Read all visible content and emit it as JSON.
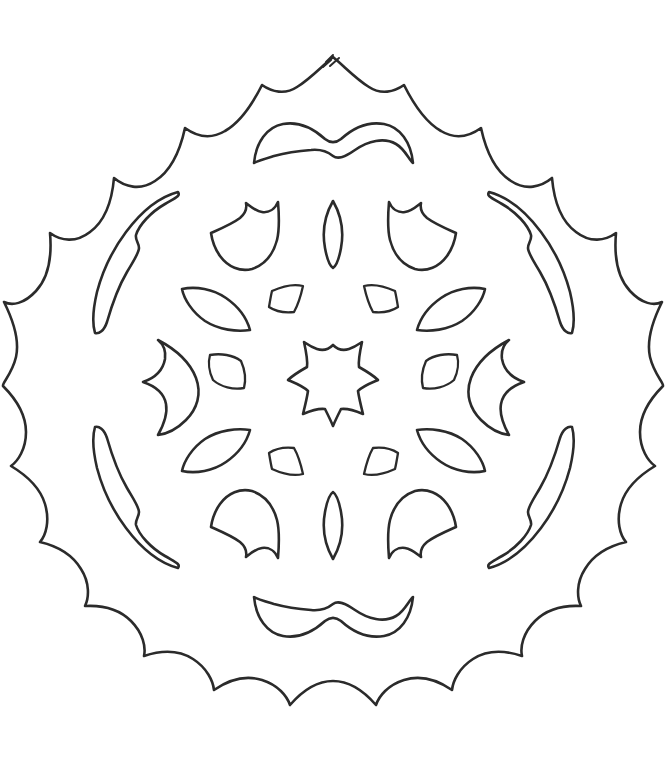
{
  "page": {
    "kind": "line-art-coloring-page",
    "width": 667,
    "height": 763,
    "background_color": "#ffffff",
    "ink_color": "#2b2b2b",
    "stroke_width": 2.6,
    "style": "hand-drawn pencil outline, no fill, no shading, no text"
  },
  "artwork": {
    "name": "snowflake-mandala",
    "description": "A radially symmetric hand drawn snowflake / doily mandala with a scalloped wavy rim and many cut-out shapes inside.",
    "symmetry": "bilateral (mirrored left-right and top-bottom), approximately 6-fold radial",
    "center": {
      "x": 333,
      "y": 380
    },
    "outer_radius_max": 300,
    "outer_radius_min": 262,
    "scallop_count": 16,
    "apex_points": [
      "top",
      "bottom"
    ],
    "elements": [
      {
        "id": "outer-rim",
        "label": "scalloped outer boundary",
        "count": 1,
        "shape": "wavy closed contour with 16 rounded lobes and sharp apex at top and bottom"
      },
      {
        "id": "top-crescent",
        "label": "top crescent arc",
        "count": 1,
        "shape": "wide moustache / crescent band with a notch in the middle"
      },
      {
        "id": "bottom-crescent",
        "label": "bottom crescent arc",
        "count": 1,
        "shape": "wide moustache / crescent band mirrored vertically"
      },
      {
        "id": "corner-blades",
        "label": "long curved blade cut-outs near rim",
        "count": 4,
        "positions": [
          "top-left",
          "top-right",
          "bottom-left",
          "bottom-right"
        ],
        "shape": "long tapering S-curved sliver"
      },
      {
        "id": "shell-fans",
        "label": "fan / shell shapes",
        "count": 4,
        "positions": [
          "upper-left",
          "upper-right",
          "lower-left",
          "lower-right"
        ],
        "shape": "rounded fan with two concave notches"
      },
      {
        "id": "side-claws",
        "label": "side claw shapes",
        "count": 2,
        "positions": [
          "mid-left",
          "mid-right"
        ],
        "shape": "leaf with concave inner back and pointed tips"
      },
      {
        "id": "petals",
        "label": "pointed leaf petals",
        "count": 4,
        "positions": [
          "upper-left",
          "upper-right",
          "lower-left",
          "lower-right"
        ],
        "shape": "pointed almond leaf"
      },
      {
        "id": "small-wedges",
        "label": "small quadrilateral wedges",
        "count": 8,
        "shape": "small four sided wedge with curved edges"
      },
      {
        "id": "lens-ovals",
        "label": "narrow vertical lens ovals",
        "count": 4,
        "positions": [
          "top-center",
          "bottom-center",
          "mid-left-inner",
          "mid-right-inner"
        ],
        "shape": "tall narrow pointed oval"
      },
      {
        "id": "center-star",
        "label": "central six pointed star",
        "count": 1,
        "shape": "small irregular 6 pointed star outline"
      }
    ],
    "colors": {
      "paper": "#ffffff",
      "line": "#2b2b2b"
    }
  }
}
